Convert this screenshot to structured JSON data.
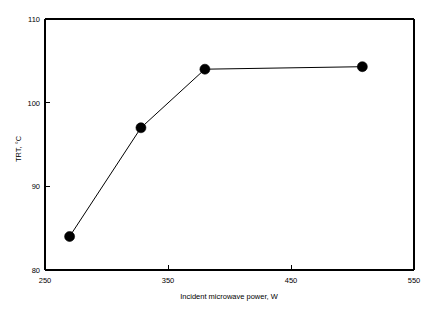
{
  "chart_data": {
    "type": "line",
    "title": "",
    "xlabel": "Incident microwave power, W",
    "ylabel": "TRT, °C",
    "xlim": [
      250,
      550
    ],
    "ylim": [
      80,
      110
    ],
    "xticks": [
      250,
      350,
      450,
      550
    ],
    "yticks": [
      80,
      90,
      100,
      110
    ],
    "xtick_labels": [
      "250",
      "350",
      "450",
      "550"
    ],
    "ytick_labels": [
      "80",
      "90",
      "100",
      "110"
    ],
    "grid": false,
    "legend": null,
    "marker": "filled-circle",
    "marker_color": "#000000",
    "line_color": "#000000",
    "background_color": "#ffffff",
    "x": [
      270,
      328,
      380,
      508
    ],
    "y": [
      84,
      97,
      104,
      104.3
    ],
    "series": [
      {
        "name": "TRT vs incident microwave power",
        "x": [
          270,
          328,
          380,
          508
        ],
        "values": [
          84,
          97,
          104,
          104.3
        ]
      }
    ],
    "points": [
      {
        "x": 270,
        "y": 84
      },
      {
        "x": 328,
        "y": 97
      },
      {
        "x": 380,
        "y": 104
      },
      {
        "x": 508,
        "y": 104.3
      }
    ]
  },
  "axes": {
    "x_title": "Incident microwave power, W",
    "y_title": "TRT, °C",
    "x_ticks": [
      "250",
      "350",
      "450",
      "550"
    ],
    "y_ticks": [
      "110",
      "100",
      "90",
      "80"
    ]
  }
}
